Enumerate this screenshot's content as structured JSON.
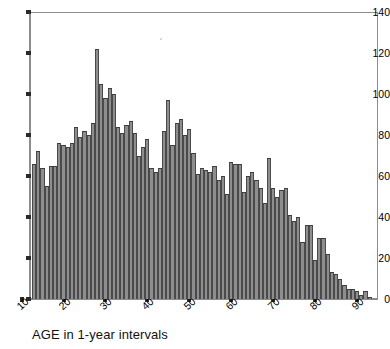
{
  "chart_data": {
    "type": "bar",
    "title": "",
    "subtitle": "",
    "xlabel": "AGE in 1-year intervals",
    "ylabel": "",
    "xlim": [
      12,
      95
    ],
    "ylim": [
      0,
      140
    ],
    "grid": false,
    "legend": null,
    "bar_color": "#8e8e8e",
    "bar_edge_color": "#4a4a4a",
    "axis_color": "#8c8c93",
    "bin_width": 1,
    "x_ticks": [
      10,
      20,
      30,
      40,
      50,
      60,
      70,
      80,
      90
    ],
    "x_tick_labels": [
      "10",
      "20",
      "30",
      "40",
      "50",
      "60",
      "70",
      "80",
      "90"
    ],
    "y_ticks": [
      0,
      20,
      40,
      60,
      80,
      100,
      120,
      140
    ],
    "y_tick_labels": [
      "0",
      "20",
      "40",
      "60",
      "80",
      "100",
      "120",
      "140"
    ],
    "categories": [
      13,
      14,
      15,
      16,
      17,
      18,
      19,
      20,
      21,
      22,
      23,
      24,
      25,
      26,
      27,
      28,
      29,
      30,
      31,
      32,
      33,
      34,
      35,
      36,
      37,
      38,
      39,
      40,
      41,
      42,
      43,
      44,
      45,
      46,
      47,
      48,
      49,
      50,
      51,
      52,
      53,
      54,
      55,
      56,
      57,
      58,
      59,
      60,
      61,
      62,
      63,
      64,
      65,
      66,
      67,
      68,
      69,
      70,
      71,
      72,
      73,
      74,
      75,
      76,
      77,
      78,
      79,
      80,
      81,
      82,
      83,
      84,
      85,
      86,
      87,
      88,
      89,
      90,
      91,
      92,
      93
    ],
    "values": [
      66,
      72,
      64,
      55,
      65,
      65,
      76,
      75,
      74,
      76,
      84,
      79,
      82,
      80,
      86,
      122,
      105,
      98,
      103,
      100,
      84,
      81,
      85,
      87,
      81,
      70,
      74,
      78,
      64,
      62,
      64,
      82,
      97,
      75,
      86,
      88,
      80,
      83,
      71,
      61,
      64,
      63,
      62,
      65,
      58,
      60,
      51,
      67,
      66,
      66,
      52,
      60,
      62,
      58,
      54,
      47,
      69,
      54,
      50,
      53,
      54,
      41,
      38,
      40,
      28,
      36,
      36,
      19,
      30,
      30,
      22,
      13,
      12,
      10,
      7,
      5,
      5,
      4,
      2,
      4,
      1
    ],
    "max_value": 122,
    "max_value_age": 28
  },
  "axis": {
    "y_title": "",
    "x_caption": "AGE in 1-year intervals"
  }
}
